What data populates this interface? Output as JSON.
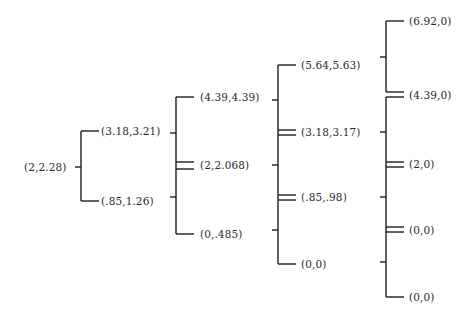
{
  "diagram": {
    "type": "tree",
    "levels": [
      {
        "nodes": [
          {
            "label": "(2,2.28)",
            "x": 24,
            "y": 167
          }
        ]
      },
      {
        "nodes": [
          {
            "label": "(3.18,3.21)",
            "x": 101,
            "y": 131
          },
          {
            "label": "(.85,1.26)",
            "x": 101,
            "y": 201
          }
        ]
      },
      {
        "nodes": [
          {
            "label": "(4.39,4.39)",
            "x": 200,
            "y": 97
          },
          {
            "label": "(2,2.068)",
            "x": 200,
            "y": 165
          },
          {
            "label": "(0,.485)",
            "x": 200,
            "y": 234
          }
        ]
      },
      {
        "nodes": [
          {
            "label": "(5.64,5.63)",
            "x": 301,
            "y": 65
          },
          {
            "label": "(3.18,3.17)",
            "x": 301,
            "y": 132
          },
          {
            "label": "(.85,.98)",
            "x": 301,
            "y": 197
          },
          {
            "label": "(0,0)",
            "x": 301,
            "y": 264
          }
        ]
      },
      {
        "nodes": [
          {
            "label": "(6.92,0)",
            "x": 409,
            "y": 21
          },
          {
            "label": "(4.39,0)",
            "x": 409,
            "y": 95
          },
          {
            "label": "(2,0)",
            "x": 409,
            "y": 164
          },
          {
            "label": "(0,0)",
            "x": 409,
            "y": 230
          },
          {
            "label": "(0,0)",
            "x": 409,
            "y": 297
          }
        ]
      }
    ]
  }
}
